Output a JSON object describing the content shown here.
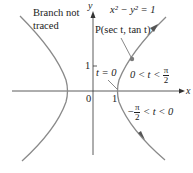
{
  "diagram": {
    "axes": {
      "x_label": "x",
      "y_label": "y",
      "origin_label": "0",
      "x_tick_label": "1",
      "y_tick_label": "1"
    },
    "labels": {
      "equation": "x² − y² = 1",
      "point": "P(sec t, tan t)",
      "branch_note_line1": "Branch not",
      "branch_note_line2": "traced",
      "t_zero": "t = 0",
      "upper_range_prefix": "0 < t <",
      "upper_range_num": "π",
      "upper_range_den": "2",
      "lower_range_prefix": "−",
      "lower_range_num": "π",
      "lower_range_den": "2",
      "lower_range_suffix": "< t < 0"
    },
    "colors": {
      "curve": "#8a8a8a",
      "axis": "#333333",
      "point": "#7a7a7a",
      "text": "#222222"
    }
  }
}
